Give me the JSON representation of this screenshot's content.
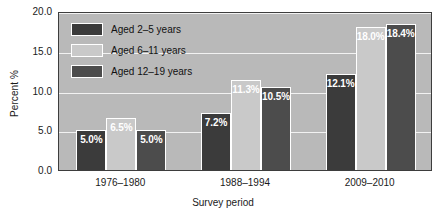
{
  "chart_data": {
    "type": "bar",
    "title": "",
    "subtitle": "",
    "xlabel": "Survey period",
    "ylabel": "Percent %",
    "categories": [
      "1976–1980",
      "1988–1994",
      "2009–2010"
    ],
    "series": [
      {
        "name": "Aged 2–5 years",
        "color": "#3b3b3b",
        "values": [
          5.0,
          7.2,
          12.1
        ],
        "labels": [
          "5.0%",
          "7.2%",
          "12.1%"
        ]
      },
      {
        "name": "Aged 6–11 years",
        "color": "#c9c9c9",
        "values": [
          6.5,
          11.3,
          18.0
        ],
        "labels": [
          "6.5%",
          "11.3%",
          "18.0%"
        ]
      },
      {
        "name": "Aged 12–19 years",
        "color": "#4c4c4c",
        "values": [
          5.0,
          10.5,
          18.4
        ],
        "labels": [
          "5.0%",
          "10.5%",
          "18.4%"
        ]
      }
    ],
    "ylim": [
      0.0,
      20.0
    ],
    "ytick_values": [
      0.0,
      5.0,
      10.0,
      15.0,
      20.0
    ],
    "ytick_labels": [
      "0.0",
      "5.0",
      "10.0",
      "15.0",
      "20.0"
    ],
    "grid": true,
    "grid_color": "#f2f2f2",
    "legend_position": "upper-left-inside",
    "plot_background": "#b9b9b9",
    "figure_background": "#ffffff",
    "value_label_color": "#ffffff"
  }
}
